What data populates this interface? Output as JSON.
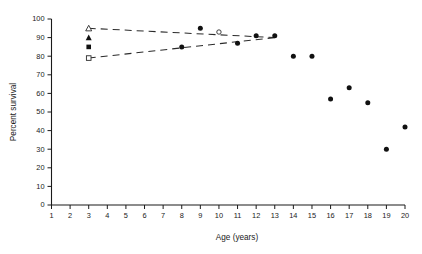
{
  "chart_data": {
    "type": "scatter",
    "title": "",
    "xlabel": "Age (years)",
    "ylabel": "Percent survival",
    "xlim": [
      1,
      20
    ],
    "ylim": [
      0,
      100
    ],
    "grid": false,
    "legend_position": "none",
    "x_ticks": [
      1,
      2,
      3,
      4,
      5,
      6,
      7,
      8,
      9,
      10,
      11,
      12,
      13,
      14,
      15,
      16,
      17,
      18,
      19,
      20
    ],
    "y_ticks": [
      0,
      10,
      20,
      30,
      40,
      50,
      60,
      70,
      80,
      90,
      100
    ],
    "series": [
      {
        "name": "Observed percent survival",
        "marker": "filled-circle",
        "x": [
          8,
          9,
          11,
          12,
          13,
          14,
          15,
          16,
          17,
          18,
          19,
          20
        ],
        "values": [
          85,
          95,
          87,
          91,
          91,
          80,
          80,
          57,
          63,
          55,
          30,
          42
        ]
      },
      {
        "name": "Open circle point",
        "marker": "open-circle",
        "x": [
          10
        ],
        "values": [
          93
        ]
      },
      {
        "name": "Open triangle marker",
        "marker": "open-triangle",
        "x": [
          3
        ],
        "values": [
          95
        ]
      },
      {
        "name": "Filled triangle marker",
        "marker": "filled-triangle",
        "x": [
          3
        ],
        "values": [
          90
        ]
      },
      {
        "name": "Filled square marker",
        "marker": "filled-square",
        "x": [
          3
        ],
        "values": [
          85
        ]
      },
      {
        "name": "Open square marker",
        "marker": "open-square",
        "x": [
          3
        ],
        "values": [
          79
        ]
      }
    ],
    "trend_lines": [
      {
        "name": "Upper dashed trend",
        "style": "dashed",
        "x": [
          3,
          13
        ],
        "values": [
          95,
          90
        ]
      },
      {
        "name": "Lower dashed trend",
        "style": "dashed",
        "x": [
          3,
          13
        ],
        "values": [
          79,
          90
        ]
      }
    ]
  }
}
